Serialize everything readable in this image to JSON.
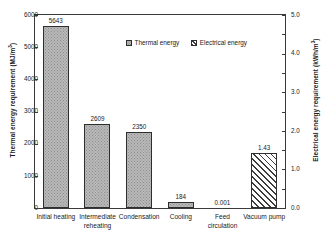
{
  "chart_data": {
    "type": "bar",
    "title": "",
    "xlabel": "",
    "ylabel": "Thermal energy requirement (MJ/m3)",
    "y2label": "Electrical energy requirement (kWh/m3)",
    "ylim": [
      0,
      6000
    ],
    "y2lim": [
      0.0,
      5.0
    ],
    "grid": false,
    "legend_position": "upper-center",
    "categories": [
      "Initial heating",
      "Intermediate\nreheating",
      "Condensation",
      "Cooling",
      "Feed\ncirculation",
      "Vacuum pump"
    ],
    "series": [
      {
        "name": "Thermal energy",
        "axis": "left",
        "unit": "MJ/m3",
        "values": [
          5643,
          2609,
          2350,
          184,
          0.001,
          null
        ],
        "labels": [
          "5643",
          "2609",
          "2350",
          "184",
          "0.001",
          ""
        ]
      },
      {
        "name": "Electrical energy",
        "axis": "right",
        "unit": "kWh/m3",
        "values": [
          null,
          null,
          null,
          null,
          null,
          1.43
        ],
        "labels": [
          "",
          "",
          "",
          "",
          "",
          "1.43"
        ]
      }
    ],
    "left_ticks": [
      "0",
      "1000",
      "2000",
      "3000",
      "4000",
      "5000",
      "6000"
    ],
    "right_ticks": [
      "0.0",
      "0.5",
      "1.0",
      "1.5",
      "2.0",
      "2.5",
      "3.0",
      "3.5",
      "4.0",
      "4.5",
      "5.0"
    ],
    "right_ticks_labeled": [
      "0.0",
      "1.0",
      "2.0",
      "3.0",
      "4.0",
      "5.0"
    ],
    "colors": {
      "thermal_fill": "#b9b9b9",
      "electrical_fill": "#ffffff",
      "outline": "#2e2e2e",
      "text": "#1a1a1a"
    }
  },
  "axes": {
    "left_title_main": "Thermal energy requirement (MJ/m",
    "left_title_sup": "3",
    "left_title_tail": ")",
    "right_title_main": "Electrical energy requirement (kWh/m",
    "right_title_sup": "3",
    "right_title_tail": ")"
  },
  "legend": {
    "items": [
      {
        "label": "Thermal energy"
      },
      {
        "label": "Electrical energy"
      }
    ]
  },
  "ticks": {
    "left": [
      {
        "label": "6000",
        "value": 6000
      },
      {
        "label": "5000",
        "value": 5000
      },
      {
        "label": "4000",
        "value": 4000
      },
      {
        "label": "3000",
        "value": 3000
      },
      {
        "label": "2000",
        "value": 2000
      },
      {
        "label": "1000",
        "value": 1000
      },
      {
        "label": "0",
        "value": 0
      }
    ],
    "right": [
      {
        "label": "5.0",
        "value": 5.0
      },
      {
        "label": "4.0",
        "value": 4.0
      },
      {
        "label": "3.0",
        "value": 3.0
      },
      {
        "label": "2.0",
        "value": 2.0
      },
      {
        "label": "1.0",
        "value": 1.0
      },
      {
        "label": "0.0",
        "value": 0.0
      }
    ]
  }
}
